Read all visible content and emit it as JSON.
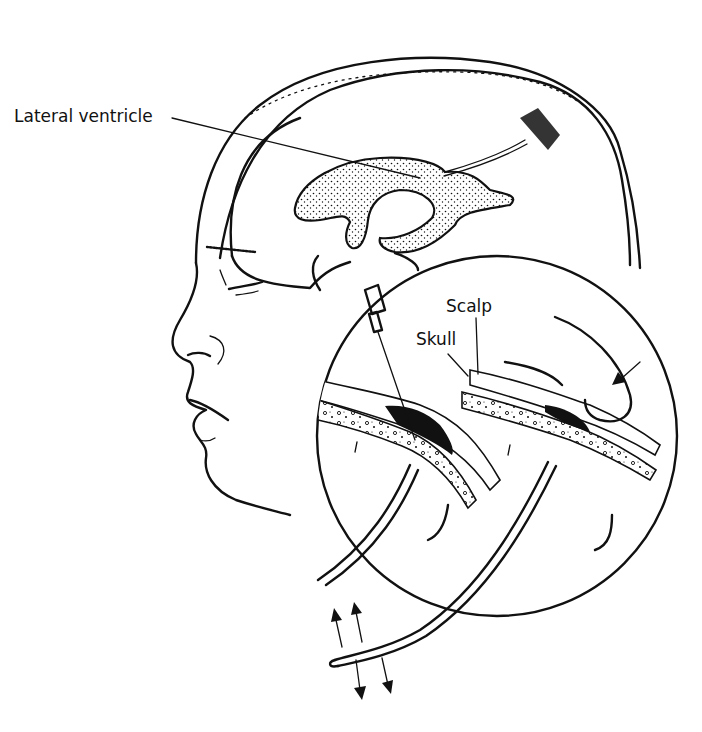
{
  "figure": {
    "labels": {
      "lateral_ventricle": "Lateral ventricle",
      "scalp": "Scalp",
      "skull": "Skull"
    },
    "icons": [
      "arrow-up-icon",
      "arrow-up-icon",
      "arrow-down-icon",
      "arrow-down-icon",
      "pressure-arrow-icon"
    ],
    "colors": {
      "ink": "#111111",
      "background": "#ffffff"
    }
  }
}
